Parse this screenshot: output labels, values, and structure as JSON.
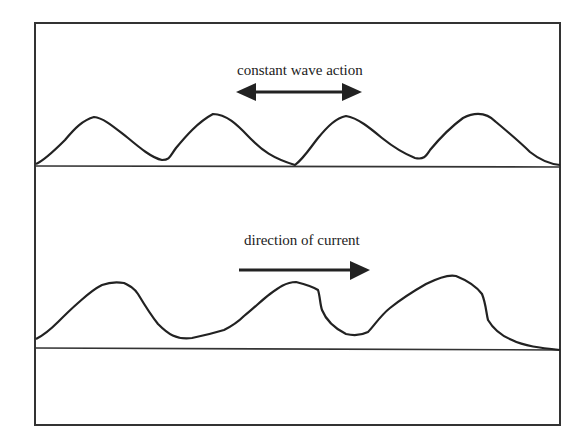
{
  "diagram": {
    "panels": [
      {
        "id": "wave",
        "label": "constant wave action",
        "arrow": "bidirectional",
        "description": "symmetrical ripples"
      },
      {
        "id": "current",
        "label": "direction of current",
        "arrow": "right",
        "description": "asymmetrical ripples"
      }
    ],
    "colors": {
      "stroke": "#222222",
      "background": "#ffffff"
    }
  }
}
